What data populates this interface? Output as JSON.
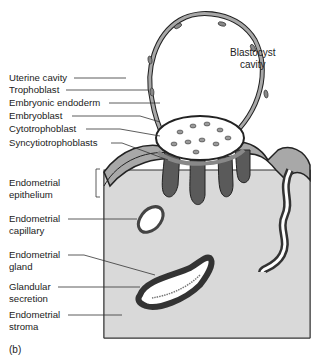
{
  "figure": {
    "panel_label": "(b)",
    "cavity_label_line1": "Blastocyst",
    "cavity_label_line2": "cavity",
    "labels": [
      {
        "line1": "Uterine cavity",
        "line2": ""
      },
      {
        "line1": "Trophoblast",
        "line2": ""
      },
      {
        "line1": "Embryonic endoderm",
        "line2": ""
      },
      {
        "line1": "Embryoblast",
        "line2": ""
      },
      {
        "line1": "Cytotrophoblast",
        "line2": ""
      },
      {
        "line1": "Syncytiotrophoblasts",
        "line2": ""
      },
      {
        "line1": "Endometrial",
        "line2": "epithelium"
      },
      {
        "line1": "Endometrial",
        "line2": "capillary"
      },
      {
        "line1": "Endometrial",
        "line2": "gland"
      },
      {
        "line1": "Glandular",
        "line2": "secretion"
      },
      {
        "line1": "Endometrial",
        "line2": "stroma"
      }
    ]
  },
  "colors": {
    "stroma": "#d9d9d9",
    "epithelium": "#a8a8a8",
    "syncytio": "#5a5a5a",
    "outline": "#222222",
    "embryoblast": "#ffffff"
  }
}
